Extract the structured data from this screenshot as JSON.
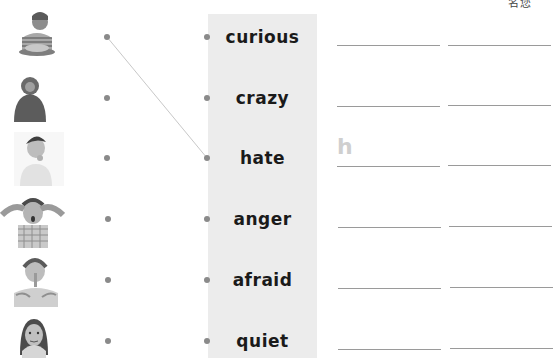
{
  "header": {
    "fragment": "名您"
  },
  "pictures": [
    {
      "label": "boy-with-food-photo",
      "y": 10
    },
    {
      "label": "hooded-figure-photo",
      "y": 70
    },
    {
      "label": "thinking-girl-photo",
      "y": 130
    },
    {
      "label": "angry-child-photo",
      "y": 193
    },
    {
      "label": "shushing-girl-photo",
      "y": 253
    },
    {
      "label": "scared-girl-photo",
      "y": 313
    }
  ],
  "words": [
    {
      "label": "curious",
      "y": 37
    },
    {
      "label": "crazy",
      "y": 98
    },
    {
      "label": "hate",
      "y": 158
    },
    {
      "label": "anger",
      "y": 219
    },
    {
      "label": "afraid",
      "y": 280
    },
    {
      "label": "quiet",
      "y": 341
    }
  ],
  "connections": [
    {
      "from_picture": 0,
      "to_word": 2
    }
  ],
  "answer_lines": [
    {
      "y": 45,
      "hint": ""
    },
    {
      "y": 106,
      "hint": ""
    },
    {
      "y": 166,
      "hint": "h"
    },
    {
      "y": 227,
      "hint": ""
    },
    {
      "y": 288,
      "hint": ""
    },
    {
      "y": 349,
      "hint": ""
    }
  ],
  "colors": {
    "panel": "#ececec",
    "dot": "#8a8a8a",
    "line": "#9a9a9a",
    "hint": "#cfcfcf",
    "text": "#1a1a1a"
  }
}
